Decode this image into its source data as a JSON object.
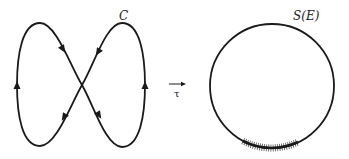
{
  "diagram": {
    "colors": {
      "background": "#ffffff",
      "stroke": "#1a1a1a"
    },
    "left_figure": {
      "label": "C",
      "shape": "figure-eight closed curve with direction arrows",
      "arrows": [
        {
          "position": "upper-left diagonal",
          "direction": "down-right"
        },
        {
          "position": "upper-right diagonal",
          "direction": "down-left"
        },
        {
          "position": "left side",
          "direction": "up"
        },
        {
          "position": "right side",
          "direction": "up"
        },
        {
          "position": "lower-left diagonal",
          "direction": "down-left"
        },
        {
          "position": "lower-right diagonal",
          "direction": "down-right"
        }
      ]
    },
    "mapping": {
      "label": "τ",
      "symbol": "right-arrow"
    },
    "right_figure": {
      "label": "S(E)",
      "shape": "circle",
      "highlight": "hatched arc at bottom of circle"
    }
  }
}
